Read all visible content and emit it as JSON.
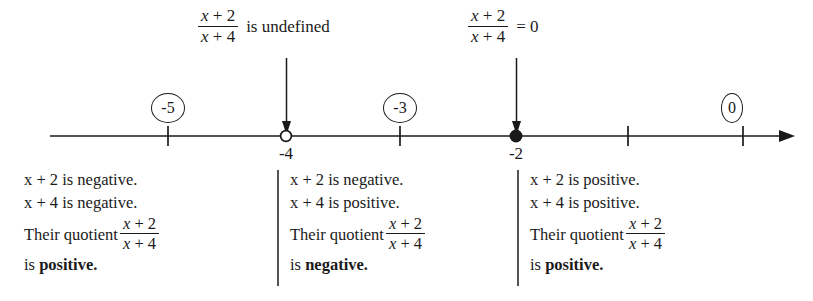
{
  "expression": {
    "numerator_var": "x",
    "numerator_op": "+",
    "numerator_const": "2",
    "denominator_var": "x",
    "denominator_op": "+",
    "denominator_const": "4"
  },
  "callouts": [
    {
      "id": "undefined",
      "text": "is undefined",
      "point": "-4",
      "arrow": "down-arrow-icon"
    },
    {
      "id": "zero",
      "text": "= 0",
      "point": "-2",
      "arrow": "down-arrow-icon"
    }
  ],
  "number_line": {
    "ticks": [
      {
        "value": "-5",
        "label": ""
      },
      {
        "value": "-4",
        "label": "-4"
      },
      {
        "value": "-3",
        "label": ""
      },
      {
        "value": "-2",
        "label": "-2"
      },
      {
        "value": "-1",
        "label": ""
      },
      {
        "value": "0",
        "label": ""
      }
    ],
    "points": [
      {
        "value": "-4",
        "style": "open",
        "label": "-4"
      },
      {
        "value": "-2",
        "style": "closed",
        "label": "-2"
      }
    ],
    "region_labels": [
      {
        "text": "-5",
        "shape": "circle"
      },
      {
        "text": "-3",
        "shape": "circle"
      },
      {
        "text": "0",
        "shape": "circle"
      }
    ]
  },
  "analysis": {
    "quotient_lead": "Their quotient",
    "is_word": "is",
    "columns": [
      {
        "numerator_sign": "x + 2 is negative.",
        "denominator_sign": "x + 4 is negative.",
        "result": "positive."
      },
      {
        "numerator_sign": "x + 2 is negative.",
        "denominator_sign": "x + 4 is positive.",
        "result": "negative."
      },
      {
        "numerator_sign": "x + 2 is positive.",
        "denominator_sign": "x + 4 is positive.",
        "result": "positive."
      }
    ]
  },
  "colors": {
    "ink": "#1a1a1a",
    "background": "#ffffff",
    "divider": "#555555"
  }
}
